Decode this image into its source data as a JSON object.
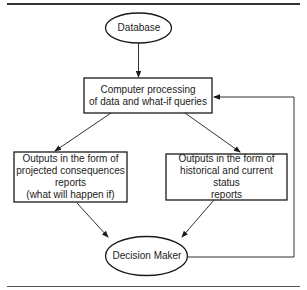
{
  "diagram": {
    "type": "flowchart",
    "nodes": {
      "database": {
        "label": "Database",
        "shape": "ellipse"
      },
      "processing": {
        "label": "Computer processing of data and what-if queries",
        "lines": [
          "Computer processing",
          "of data and what-if queries"
        ],
        "shape": "rectangle"
      },
      "projected": {
        "label": "Outputs in the form of projected consequences reports (what will happen if)",
        "lines": [
          "Outputs in the form of",
          "projected consequences",
          "reports",
          "(what will happen if)"
        ],
        "shape": "rectangle"
      },
      "historical": {
        "label": "Outputs in the form of historical and current status reports",
        "lines": [
          "Outputs in the form of",
          "historical and current status",
          "reports"
        ],
        "shape": "rectangle"
      },
      "decision_maker": {
        "label": "Decision Maker",
        "shape": "ellipse"
      }
    },
    "edges": [
      {
        "from": "database",
        "to": "processing"
      },
      {
        "from": "processing",
        "to": "projected"
      },
      {
        "from": "processing",
        "to": "historical"
      },
      {
        "from": "projected",
        "to": "decision_maker"
      },
      {
        "from": "historical",
        "to": "decision_maker"
      },
      {
        "from": "decision_maker",
        "to": "processing",
        "kind": "feedback"
      }
    ],
    "colors": {
      "stroke": "#1a1a1a",
      "text": "#222222",
      "background": "#ffffff"
    }
  }
}
